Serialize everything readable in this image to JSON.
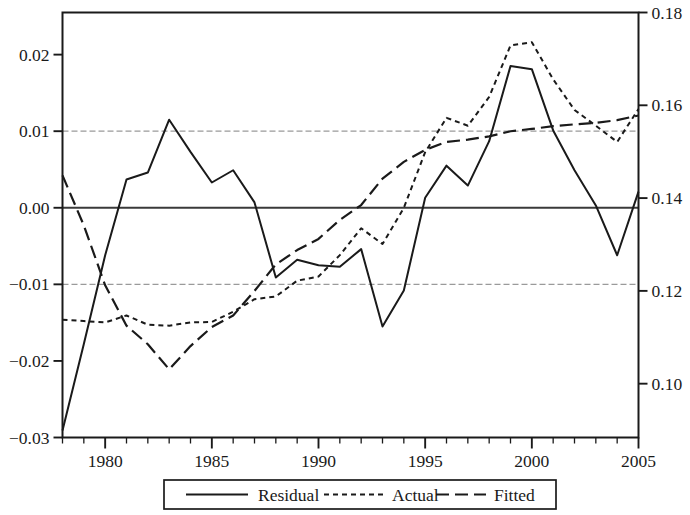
{
  "chart_data": {
    "type": "line",
    "title": "",
    "xlabel": "",
    "ylabel_left": "",
    "ylabel_right": "",
    "grid": true,
    "legend_position": "bottom",
    "x": [
      1978,
      1979,
      1980,
      1981,
      1982,
      1983,
      1984,
      1985,
      1986,
      1987,
      1988,
      1989,
      1990,
      1991,
      1992,
      1993,
      1994,
      1995,
      1996,
      1997,
      1998,
      1999,
      2000,
      2001,
      2002,
      2003,
      2004,
      2005
    ],
    "xlim": [
      1978,
      2005
    ],
    "xticks": [
      1980,
      1985,
      1990,
      1995,
      2000,
      2005
    ],
    "xticklabels": [
      "1980",
      "1985",
      "1990",
      "1995",
      "2000",
      "2005"
    ],
    "xminor_tick_step": 1,
    "left_axis": {
      "name": "Residual",
      "ylim": [
        -0.03,
        0.0255
      ],
      "yticks": [
        0.02,
        0.01,
        0.0,
        -0.01,
        -0.02,
        -0.03
      ],
      "yticklabels": [
        "0.02",
        "0.01",
        "0.00",
        "−0.01",
        "−0.02",
        "−0.03"
      ]
    },
    "right_axis": {
      "name": "Actual / Fitted",
      "ylim": [
        0.0884,
        0.18
      ],
      "yticks": [
        0.18,
        0.16,
        0.14,
        0.12,
        0.1
      ],
      "yticklabels": [
        "0.18",
        "0.16",
        "0.14",
        "0.12",
        "0.10"
      ]
    },
    "gridlines": [
      {
        "value": 0.01,
        "axis": "left",
        "style": "dashed",
        "color": "#9a9a9a"
      },
      {
        "value": 0.0,
        "axis": "left",
        "style": "solid",
        "color": "#3a3a3a"
      },
      {
        "value": -0.01,
        "axis": "left",
        "style": "dashed",
        "color": "#9a9a9a"
      }
    ],
    "series": [
      {
        "name": "Residual",
        "axis": "left",
        "style": "solid",
        "color": "#1a1a1a",
        "values": [
          -0.0291,
          -0.0178,
          -0.0062,
          0.0037,
          0.0046,
          0.0115,
          0.0073,
          0.0033,
          0.0049,
          0.0007,
          -0.0091,
          -0.0068,
          -0.0075,
          -0.0077,
          -0.0054,
          -0.0155,
          -0.0108,
          0.0013,
          0.0055,
          0.0029,
          0.0087,
          0.0185,
          0.0181,
          0.0101,
          0.0049,
          0.0003,
          -0.0062,
          0.0021
        ]
      },
      {
        "name": "Actual",
        "axis": "right",
        "style": "dotted",
        "color": "#1a1a1a",
        "values": [
          0.1138,
          0.1135,
          0.1132,
          0.1147,
          0.1127,
          0.1125,
          0.1132,
          0.1133,
          0.1155,
          0.1182,
          0.1188,
          0.1222,
          0.1231,
          0.1277,
          0.1335,
          0.1301,
          0.1379,
          0.1499,
          0.1573,
          0.1556,
          0.1618,
          0.1729,
          0.1736,
          0.1656,
          0.159,
          0.1556,
          0.1521,
          0.1592
        ]
      },
      {
        "name": "Fitted",
        "axis": "right",
        "style": "dashed",
        "color": "#1a1a1a",
        "values": [
          0.1449,
          0.1341,
          0.1212,
          0.1125,
          0.1085,
          0.1031,
          0.1081,
          0.1122,
          0.1147,
          0.12,
          0.1257,
          0.1288,
          0.1312,
          0.1353,
          0.1385,
          0.1442,
          0.1478,
          0.1504,
          0.1521,
          0.1526,
          0.1533,
          0.1544,
          0.1549,
          0.1555,
          0.1559,
          0.1562,
          0.1568,
          0.1578
        ]
      }
    ]
  },
  "legend": {
    "entries": [
      {
        "label": "Residual",
        "style": "solid"
      },
      {
        "label": "Actual",
        "style": "dotted"
      },
      {
        "label": "Fitted",
        "style": "dashed"
      }
    ]
  }
}
